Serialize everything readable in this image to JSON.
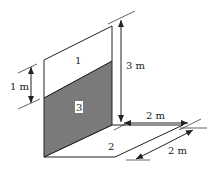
{
  "diagram": {
    "surfaces": [
      {
        "id": "1",
        "label": "1",
        "description": "upper unshaded vertical wall section"
      },
      {
        "id": "2",
        "label": "2",
        "description": "horizontal floor surface"
      },
      {
        "id": "3",
        "label": "3",
        "description": "lower shaded vertical wall section"
      }
    ],
    "dimensions": {
      "wall_height": "3 m",
      "shaded_offset": "1 m",
      "floor_width": "2 m",
      "floor_depth": "2 m"
    },
    "colors": {
      "stroke": "#222222",
      "shaded_fill": "#7a7a7a",
      "background": "#ffffff"
    }
  }
}
